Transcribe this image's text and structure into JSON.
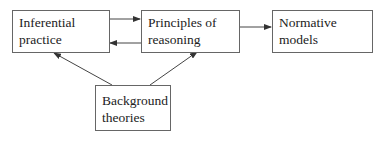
{
  "diagram": {
    "nodes": [
      {
        "id": "inferential",
        "label": "Inferential practice"
      },
      {
        "id": "principles",
        "label_line1": "Principles of",
        "label_line2": "reasoning"
      },
      {
        "id": "normative",
        "label": "Normative models"
      },
      {
        "id": "background",
        "label_line1": "Background",
        "label_line2": "theories"
      }
    ],
    "edges": [
      {
        "from": "inferential",
        "to": "principles"
      },
      {
        "from": "principles",
        "to": "inferential"
      },
      {
        "from": "principles",
        "to": "normative"
      },
      {
        "from": "background",
        "to": "inferential"
      },
      {
        "from": "background",
        "to": "principles"
      }
    ],
    "colors": {
      "border": "#666666",
      "arrow": "#333333",
      "text": "#222222"
    }
  }
}
